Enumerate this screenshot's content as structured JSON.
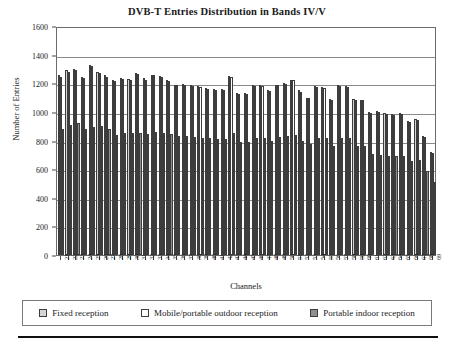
{
  "chart_data": {
    "type": "bar",
    "title": "DVB-T Entries Distribution in Bands IV/V",
    "xlabel": "Channels",
    "ylabel": "Number of Entries",
    "ylim": [
      0,
      1600
    ],
    "ytick_step": 200,
    "yticks": [
      0,
      200,
      400,
      600,
      800,
      1000,
      1200,
      1400,
      1600
    ],
    "ytick_labels": [
      "0",
      "200",
      "400",
      "600",
      "800",
      "1000",
      "1200",
      "1400",
      "1600"
    ],
    "grid": true,
    "grid_axis": "y",
    "legend_position": "below",
    "categories": [
      "21",
      "22",
      "23",
      "24",
      "25",
      "26",
      "27",
      "28",
      "29",
      "30",
      "31",
      "32",
      "33",
      "34",
      "35",
      "36",
      "37",
      "38",
      "39",
      "40",
      "41",
      "42",
      "43",
      "44",
      "45",
      "46",
      "47",
      "48",
      "49",
      "50",
      "51",
      "52",
      "53",
      "54",
      "55",
      "56",
      "57",
      "58",
      "59",
      "60",
      "61",
      "62",
      "63",
      "64",
      "65",
      "66",
      "67",
      "68",
      "69"
    ],
    "series": [
      {
        "name": "Fixed reception",
        "color": "#d4d4d4",
        "values": [
          1255,
          1290,
          1300,
          1245,
          1330,
          1280,
          1255,
          1225,
          1235,
          1230,
          1270,
          1235,
          1260,
          1250,
          1220,
          1190,
          1195,
          1190,
          1180,
          1165,
          1160,
          1160,
          1250,
          1130,
          1130,
          1185,
          1190,
          1150,
          1190,
          1200,
          1225,
          1150,
          1100,
          1180,
          1175,
          1090,
          1185,
          1180,
          1090,
          1085,
          1000,
          1005,
          990,
          985,
          990,
          935,
          950,
          830,
          720
        ]
      },
      {
        "name": "Mobile/portable outdoor reception",
        "color": "#ffffff",
        "values": [
          1245,
          1280,
          1295,
          1240,
          1320,
          1275,
          1245,
          1215,
          1230,
          1225,
          1265,
          1225,
          1255,
          1245,
          1215,
          1185,
          1190,
          1180,
          1175,
          1160,
          1150,
          1155,
          1245,
          1125,
          1125,
          1180,
          1180,
          1145,
          1185,
          1195,
          1220,
          1140,
          1095,
          1175,
          1170,
          1085,
          1180,
          1175,
          1085,
          1080,
          995,
          1000,
          985,
          980,
          985,
          930,
          945,
          825,
          715
        ]
      },
      {
        "name": "Portable indoor reception",
        "color": "#8f8f8f",
        "values": [
          880,
          905,
          920,
          880,
          895,
          900,
          880,
          840,
          850,
          850,
          855,
          845,
          860,
          855,
          845,
          830,
          830,
          825,
          820,
          815,
          810,
          810,
          855,
          790,
          790,
          820,
          820,
          800,
          825,
          830,
          840,
          800,
          775,
          820,
          815,
          765,
          820,
          815,
          765,
          760,
          705,
          700,
          695,
          690,
          695,
          660,
          665,
          585,
          510
        ]
      }
    ]
  },
  "legend": {
    "items": [
      {
        "label": "Fixed reception",
        "swatch": "fixed"
      },
      {
        "label": "Mobile/portable outdoor reception",
        "swatch": "mobile"
      },
      {
        "label": "Portable indoor reception",
        "swatch": "indoor"
      }
    ]
  }
}
